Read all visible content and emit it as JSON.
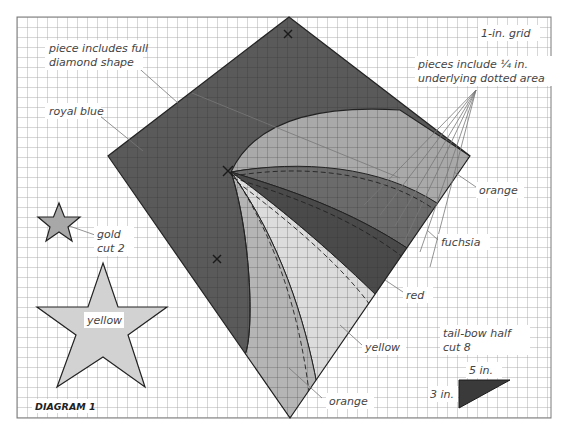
{
  "diagram": {
    "title": "DIAGRAM 1",
    "grid_label": "1-in. grid",
    "colors": {
      "royal_blue": "#5a5a5a",
      "orange": "#a9a9a9",
      "fuchsia": "#6b6b6b",
      "red": "#4a4a4a",
      "yellow_light": "#dcdcdc",
      "yellow_star": "#d2d2d2",
      "gold_star": "#a8a8a8",
      "grid_line": "#9a9a9a",
      "outline": "#222222"
    },
    "labels": {
      "full_diamond": [
        "piece includes full",
        "diamond shape"
      ],
      "royal_blue": "royal blue",
      "seam_allowance": [
        "pieces include ¼ in.",
        "underlying dotted area"
      ],
      "orange_top": "orange",
      "fuchsia": "fuchsia",
      "red": "red",
      "yellow": "yellow",
      "orange_bottom": "orange",
      "gold": [
        "gold",
        "cut 2"
      ],
      "yellow_star": "yellow",
      "tail_bow": [
        "tail-bow half",
        "cut 8"
      ],
      "tail_width": "5 in.",
      "tail_height": "3 in."
    },
    "markers": [
      "x-mark-top",
      "x-mark-left",
      "x-mark-lower"
    ]
  }
}
